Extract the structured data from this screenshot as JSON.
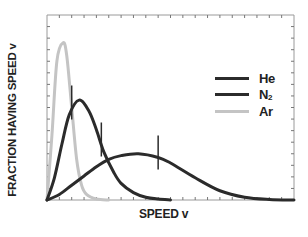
{
  "chart_data": {
    "type": "line",
    "title": "",
    "xlabel": "SPEED v",
    "ylabel": "FRACTION HAVING SPEED v",
    "grid": false,
    "legend_position": "right-middle",
    "x_ticks_labeled": false,
    "y_ticks_labeled": false,
    "xlim": [
      0,
      1
    ],
    "ylim": [
      0,
      1
    ],
    "series": [
      {
        "name": "He",
        "color": "#2b2b2b",
        "description": "broad low peak, most probable speed ~0.37 of axis",
        "x": [
          0.0,
          0.05,
          0.1,
          0.15,
          0.2,
          0.25,
          0.3,
          0.37,
          0.45,
          0.5,
          0.6,
          0.7,
          0.8,
          0.9,
          1.0
        ],
        "values": [
          0.0,
          0.03,
          0.08,
          0.13,
          0.18,
          0.22,
          0.24,
          0.25,
          0.23,
          0.2,
          0.12,
          0.05,
          0.015,
          0.003,
          0.0
        ],
        "marker_x": 0.45
      },
      {
        "name": "N2",
        "color": "#2b2b2b",
        "description": "medium peak, most probable speed ~0.13 of axis",
        "x": [
          0.0,
          0.03,
          0.06,
          0.09,
          0.13,
          0.17,
          0.2,
          0.23,
          0.27,
          0.3,
          0.35,
          0.4,
          0.45,
          0.5
        ],
        "values": [
          0.0,
          0.12,
          0.3,
          0.46,
          0.54,
          0.48,
          0.38,
          0.26,
          0.15,
          0.09,
          0.04,
          0.015,
          0.005,
          0.0
        ],
        "marker_x": 0.22
      },
      {
        "name": "Ar",
        "color": "#c4c4c4",
        "description": "tall narrow peak, most probable speed ~0.065 of axis",
        "x": [
          0.0,
          0.02,
          0.04,
          0.065,
          0.08,
          0.1,
          0.12,
          0.14,
          0.16,
          0.2,
          0.25
        ],
        "values": [
          0.0,
          0.35,
          0.75,
          0.85,
          0.78,
          0.5,
          0.22,
          0.08,
          0.03,
          0.005,
          0.0
        ],
        "marker_x": 0.1
      }
    ]
  },
  "legend": [
    {
      "label": "He",
      "sub": "",
      "color": "#2b2b2b"
    },
    {
      "label": "N",
      "sub": "2",
      "color": "#2b2b2b"
    },
    {
      "label": "Ar",
      "sub": "",
      "color": "#c4c4c4"
    }
  ]
}
